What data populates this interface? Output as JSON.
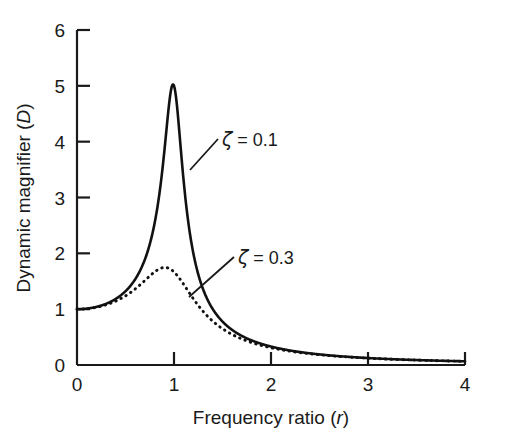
{
  "chart_data": {
    "type": "line",
    "title": "",
    "xlabel": "Frequency ratio (r)",
    "xlabel_main": "Frequency ratio (",
    "xlabel_italic": "r",
    "xlabel_close": ")",
    "ylabel": "Dynamic magnifier (D)",
    "ylabel_main": "Dynamic magnifier (",
    "ylabel_italic": "D",
    "ylabel_close": ")",
    "xlim": [
      0,
      4
    ],
    "ylim": [
      0,
      6
    ],
    "xticks": [
      0,
      1,
      2,
      3,
      4
    ],
    "xtick_labels": [
      "0",
      "1",
      "2",
      "3",
      "4"
    ],
    "yticks": [
      0,
      1,
      2,
      3,
      4,
      5,
      6
    ],
    "ytick_labels": [
      "0",
      "1",
      "2",
      "3",
      "4",
      "5",
      "6"
    ],
    "grid": false,
    "legend_position": "inline-annotations",
    "formula": "D = 1/sqrt((1-r^2)^2 + (2*zeta*r)^2)",
    "line_color": "#111111",
    "axis_color": "#1a1a1a",
    "series": [
      {
        "name": "zeta = 0.1",
        "zeta": 0.1,
        "style": "solid",
        "peak_r": 0.99,
        "peak_value": 4.97,
        "annotation": "ζ = 0.1",
        "annotation_symbol": "ζ",
        "annotation_rest": " = 0.1",
        "x": [
          0,
          0.1,
          0.2,
          0.3,
          0.4,
          0.5,
          0.6,
          0.7,
          0.8,
          0.85,
          0.9,
          0.95,
          0.99,
          1.0,
          1.05,
          1.1,
          1.15,
          1.2,
          1.3,
          1.4,
          1.5,
          1.6,
          1.8,
          2.0,
          2.25,
          2.5,
          2.75,
          3.0,
          3.25,
          3.5,
          3.75,
          4.0
        ],
        "values": [
          1.0,
          1.01,
          1.04,
          1.1,
          1.19,
          1.33,
          1.55,
          1.9,
          2.65,
          3.2,
          3.9,
          4.69,
          4.97,
          5.0,
          4.6,
          3.7,
          2.88,
          2.27,
          1.5,
          1.08,
          0.83,
          0.66,
          0.45,
          0.33,
          0.24,
          0.19,
          0.15,
          0.125,
          0.105,
          0.089,
          0.077,
          0.067
        ]
      },
      {
        "name": "zeta = 0.3",
        "zeta": 0.3,
        "style": "dotted",
        "peak_r": 0.91,
        "peak_value": 1.79,
        "annotation": "ζ = 0.3",
        "annotation_symbol": "ζ",
        "annotation_rest": " = 0.3",
        "x": [
          0,
          0.1,
          0.2,
          0.3,
          0.4,
          0.5,
          0.6,
          0.7,
          0.8,
          0.85,
          0.9,
          0.95,
          1.0,
          1.05,
          1.1,
          1.2,
          1.3,
          1.4,
          1.5,
          1.6,
          1.8,
          2.0,
          2.25,
          2.5,
          2.75,
          3.0,
          3.25,
          3.5,
          3.75,
          4.0
        ],
        "values": [
          1.0,
          1.01,
          1.04,
          1.09,
          1.17,
          1.28,
          1.42,
          1.58,
          1.72,
          1.76,
          1.79,
          1.78,
          1.67,
          1.52,
          1.36,
          1.07,
          0.85,
          0.69,
          0.57,
          0.48,
          0.36,
          0.27,
          0.21,
          0.17,
          0.14,
          0.12,
          0.1,
          0.086,
          0.075,
          0.066
        ]
      }
    ],
    "annotations": [
      {
        "text": "ζ = 0.1",
        "symbol": "ζ",
        "rest": " = 0.1",
        "label_x": 222,
        "label_y": 146,
        "leader_from_x": 190,
        "leader_from_y": 170,
        "leader_to_x": 218,
        "leader_to_y": 139
      },
      {
        "text": "ζ = 0.3",
        "symbol": "ζ",
        "rest": " = 0.3",
        "label_x": 238,
        "label_y": 264,
        "leader_from_x": 189,
        "leader_from_y": 297,
        "leader_to_x": 234,
        "leader_to_y": 257
      }
    ]
  }
}
